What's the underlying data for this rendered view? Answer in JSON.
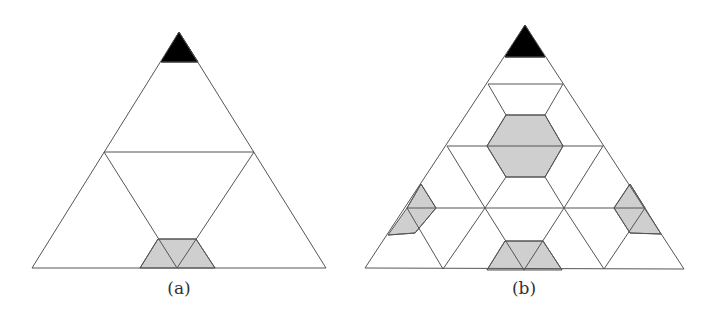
{
  "figures": [
    {
      "id": "a",
      "label": "(a)",
      "label_x": 179,
      "description": "Equilateral triangle subdivided once: top corner black, middle horizontal cut, bottom shaded trapezoid"
    },
    {
      "id": "b",
      "label": "(b)",
      "label_x": 524,
      "description": "Equilateral triangle subdivided twice: top corner black, central shaded hexagon, three shaded regions near edges"
    }
  ],
  "colors": {
    "apex": "#000000",
    "shade": "#cfcfcf",
    "edge": "#555555",
    "background": "#ffffff"
  }
}
